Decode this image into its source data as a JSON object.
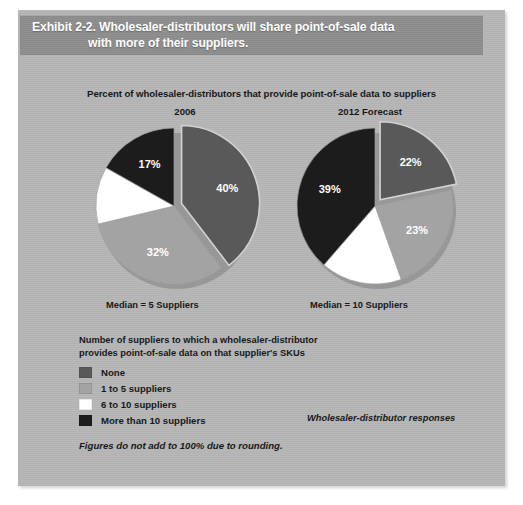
{
  "exhibit": {
    "title_line_1": "Exhibit 2-2. Wholesaler-distributors will share point-of-sale data",
    "title_line_2": "with more of their suppliers.",
    "subhead": "Percent of wholesaler-distributors that provide point-of-sale data to suppliers",
    "footnote": "Figures do not add to 100% due to rounding.",
    "responses_note": "Wholesaler-distributor responses"
  },
  "legend": {
    "heading_line_1": "Number of suppliers to which a wholesaler-distributor",
    "heading_line_2": "provides point-of-sale data on that supplier's SKUs",
    "items": [
      {
        "label": "None",
        "color": "#595959"
      },
      {
        "label": "1 to 5 suppliers",
        "color": "#a3a3a3"
      },
      {
        "label": "6 to 10 suppliers",
        "color": "#ffffff"
      },
      {
        "label": "More than 10 suppliers",
        "color": "#1c1c1c"
      }
    ]
  },
  "medians": {
    "left": "Median = 5 Suppliers",
    "right": "Median = 10 Suppliers"
  },
  "colors": {
    "panel_bg": "#b5b5b5",
    "title_bar": "#8c8c8c",
    "none": "#595959",
    "one_to_five": "#a3a3a3",
    "six_to_ten": "#ffffff",
    "more_than_ten": "#1c1c1c",
    "text": "#17181a"
  },
  "chart_data": [
    {
      "type": "pie",
      "title": "2006",
      "categories": [
        "None",
        "1 to 5 suppliers",
        "6 to 10 suppliers",
        "More than 10 suppliers"
      ],
      "values": [
        40,
        32,
        12,
        17
      ],
      "labels": [
        "40%",
        "32%",
        "12%",
        "17%"
      ],
      "colors": [
        "#595959",
        "#a3a3a3",
        "#ffffff",
        "#1c1c1c"
      ],
      "label_colors": [
        "#ffffff",
        "#ffffff",
        "#1c1c1c",
        "#ffffff"
      ],
      "exploded": [
        true,
        false,
        false,
        false
      ],
      "start_angle": -90,
      "median_note": "Median = 5 Suppliers",
      "legend_position": "bottom"
    },
    {
      "type": "pie",
      "title": "2012 Forecast",
      "categories": [
        "None",
        "1 to 5 suppliers",
        "6 to 10 suppliers",
        "More than 10 suppliers"
      ],
      "values": [
        22,
        23,
        17,
        39
      ],
      "labels": [
        "22%",
        "23%",
        "17%",
        "39%"
      ],
      "colors": [
        "#595959",
        "#a3a3a3",
        "#ffffff",
        "#1c1c1c"
      ],
      "label_colors": [
        "#ffffff",
        "#ffffff",
        "#1c1c1c",
        "#ffffff"
      ],
      "exploded": [
        true,
        false,
        false,
        false
      ],
      "start_angle": -90,
      "median_note": "Median = 10 Suppliers",
      "legend_position": "bottom"
    }
  ]
}
